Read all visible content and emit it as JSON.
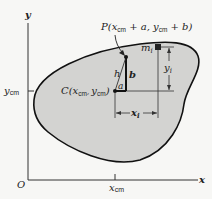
{
  "figure": {
    "axes": {
      "x_label": "x",
      "y_label": "y",
      "origin_label": "O",
      "x_tick_label": {
        "main": "x",
        "sub": "cm"
      },
      "y_tick_label": {
        "main": "y",
        "sub": "cm"
      }
    },
    "point_P": {
      "label_prefix": "P(",
      "x_main": "x",
      "x_sub": "cm",
      "x_plus": " + a, ",
      "y_main": "y",
      "y_sub": "cm",
      "y_plus": " + b)"
    },
    "point_C": {
      "label_prefix": "C(",
      "x_main": "x",
      "x_sub": "cm",
      "sep": ", ",
      "y_main": "y",
      "y_sub": "cm",
      "suffix": ")"
    },
    "segments": {
      "h": "h",
      "a": "a",
      "b": "b"
    },
    "mass_element": {
      "main": "m",
      "sub": "i"
    },
    "dimensions": {
      "x_i": {
        "main": "x",
        "sub": "i"
      },
      "y_i": {
        "main": "y",
        "sub": "i"
      }
    },
    "colors": {
      "body_fill": "#d3d3d1",
      "outline": "#111111",
      "background": "#f7f7f5",
      "line": "#333333"
    }
  }
}
